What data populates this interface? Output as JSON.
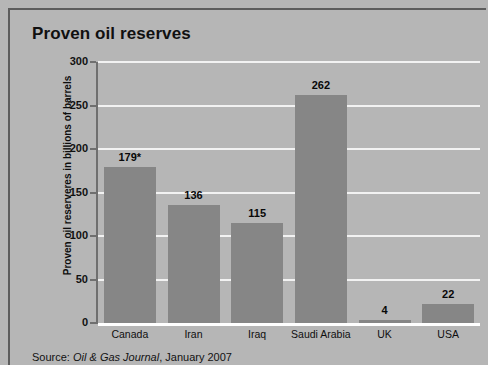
{
  "chart_title": "Proven oil reserves",
  "source": {
    "label": "Source:",
    "publication": "Oil & Gas Journal",
    "date": ", January 2007",
    "full": "Source: Oil & Gas Journal, January 2007"
  },
  "colors": {
    "background": "#b6b6b6",
    "bar": "#868686",
    "gridline": "#f2f2f2",
    "baseline": "#ffffff",
    "axis": "#6f6f6f",
    "text": "#101010",
    "frame": "#5d5d5d"
  },
  "chart_data": {
    "type": "bar",
    "title": "Proven oil reserves",
    "xlabel": "",
    "ylabel": "Proven oil reserveres in billions of barrels",
    "categories": [
      "Canada",
      "Iran",
      "Iraq",
      "Saudi Arabia",
      "UK",
      "USA"
    ],
    "values": [
      179,
      136,
      115,
      262,
      4,
      22
    ],
    "value_labels": [
      "179*",
      "136",
      "115",
      "262",
      "4",
      "22"
    ],
    "ylim": [
      0,
      300
    ],
    "yticks": [
      0,
      50,
      100,
      150,
      200,
      250,
      300
    ],
    "ytick_labels": [
      "0",
      "50",
      "100",
      "150",
      "200",
      "250",
      "300"
    ],
    "grid": true,
    "grid_axis": "y",
    "legend": false,
    "annotations": [
      "* Canada value marked with asterisk footnote"
    ]
  }
}
